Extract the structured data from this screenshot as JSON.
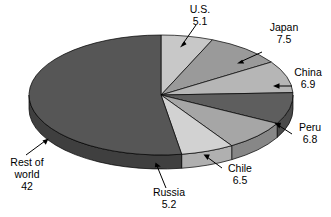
{
  "chart_data": {
    "type": "pie",
    "title": "",
    "subtitle": "",
    "xlabel": "",
    "ylabel": "",
    "three_d": true,
    "legend_position": "none",
    "labels_position": "outside-with-leader-arrows",
    "grid": false,
    "total": 80,
    "categories": [
      "U.S.",
      "Japan",
      "China",
      "Peru",
      "Chile",
      "Russia",
      "Rest of world"
    ],
    "values": [
      5.1,
      7.5,
      6.9,
      6.8,
      6.5,
      5.2,
      42
    ],
    "slices": [
      {
        "name": "U.S.",
        "label": "U.S.",
        "value": 5.1,
        "value_text": "5.1",
        "color": "#c8c8c8",
        "side_color": "#a8a8a8",
        "label_lines": [
          "U.S.",
          "5.1"
        ]
      },
      {
        "name": "Japan",
        "label": "Japan",
        "value": 7.5,
        "value_text": "7.5",
        "color": "#9a9a9a",
        "side_color": "#7d7d7d",
        "label_lines": [
          "Japan",
          "7.5"
        ]
      },
      {
        "name": "China",
        "label": "China",
        "value": 6.9,
        "value_text": "6.9",
        "color": "#b6b6b6",
        "side_color": "#979797",
        "label_lines": [
          "China",
          "6.9"
        ]
      },
      {
        "name": "Peru",
        "label": "Peru",
        "value": 6.8,
        "value_text": "6.8",
        "color": "#5e5e5e",
        "side_color": "#4a4a4a",
        "label_lines": [
          "Peru",
          "6.8"
        ]
      },
      {
        "name": "Chile",
        "label": "Chile",
        "value": 6.5,
        "value_text": "6.5",
        "color": "#a6a6a6",
        "side_color": "#878787",
        "label_lines": [
          "Chile",
          "6.5"
        ]
      },
      {
        "name": "Russia",
        "label": "Russia",
        "value": 5.2,
        "value_text": "5.2",
        "color": "#d2d2d2",
        "side_color": "#b0b0b0",
        "label_lines": [
          "Russia",
          "5.2"
        ]
      },
      {
        "name": "Rest of world",
        "label": "Rest of world",
        "value": 42,
        "value_text": "42",
        "color": "#565656",
        "side_color": "#3f3f3f",
        "label_lines": [
          "Rest of",
          "world",
          "42"
        ]
      }
    ]
  },
  "labels": {
    "us": {
      "line1": "U.S.",
      "line2": "5.1"
    },
    "japan": {
      "line1": "Japan",
      "line2": "7.5"
    },
    "china": {
      "line1": "China",
      "line2": "6.9"
    },
    "peru": {
      "line1": "Peru",
      "line2": "6.8"
    },
    "chile": {
      "line1": "Chile",
      "line2": "6.5"
    },
    "russia": {
      "line1": "Russia",
      "line2": "5.2"
    },
    "rest": {
      "line1": "Rest of",
      "line2": "world",
      "line3": "42"
    }
  },
  "colors": {
    "background": "#ffffff",
    "outline": "#000000",
    "text": "#000000"
  }
}
